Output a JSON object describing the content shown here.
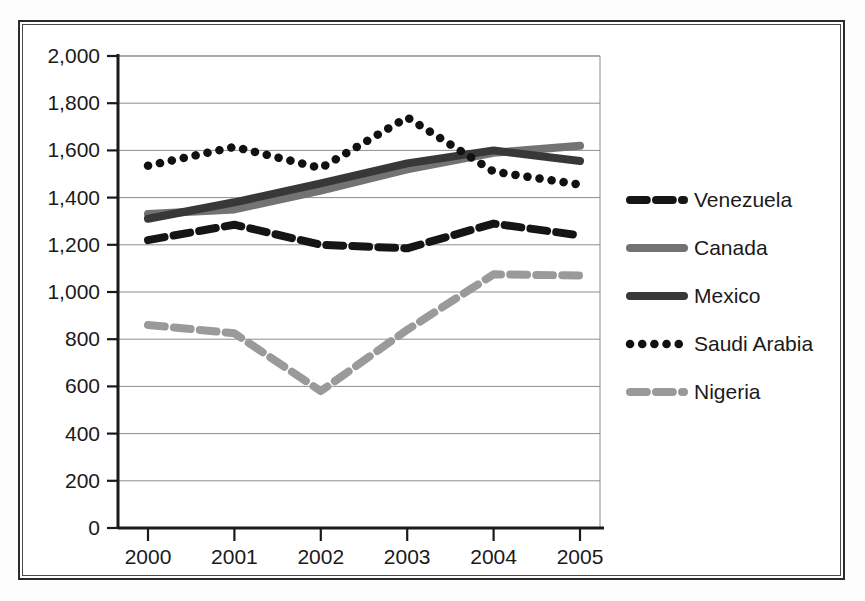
{
  "chart_data": {
    "type": "line",
    "title": "",
    "subtitle": "",
    "xlabel": "",
    "ylabel": "",
    "categories": [
      "2000",
      "2001",
      "2002",
      "2003",
      "2004",
      "2005"
    ],
    "x": [
      2000,
      2001,
      2002,
      2003,
      2004,
      2005
    ],
    "xlim": [
      2000,
      2005
    ],
    "ylim": [
      0,
      2000
    ],
    "ytick_labels": [
      "0",
      "200",
      "400",
      "600",
      "800",
      "1,000",
      "1,200",
      "1,400",
      "1,600",
      "1,800",
      "2,000"
    ],
    "ytick_values": [
      0,
      200,
      400,
      600,
      800,
      1000,
      1200,
      1400,
      1600,
      1800,
      2000
    ],
    "grid": "horizontal",
    "legend_position": "right",
    "series": [
      {
        "name": "Venezuela",
        "style": "dashed",
        "color": "#151515",
        "values": [
          1220,
          1285,
          1200,
          1185,
          1290,
          1240
        ]
      },
      {
        "name": "Canada",
        "style": "solid",
        "color": "#737373",
        "values": [
          1330,
          1350,
          1430,
          1520,
          1590,
          1620
        ]
      },
      {
        "name": "Mexico",
        "style": "solid",
        "color": "#383838",
        "values": [
          1310,
          1380,
          1460,
          1545,
          1600,
          1555
        ]
      },
      {
        "name": "Saudi Arabia",
        "style": "dotted",
        "color": "#111111",
        "values": [
          1535,
          1615,
          1525,
          1740,
          1510,
          1455
        ]
      },
      {
        "name": "Nigeria",
        "style": "dashed",
        "color": "#9a9a9a",
        "values": [
          860,
          825,
          580,
          840,
          1075,
          1070
        ]
      }
    ]
  },
  "legend": {
    "items": [
      {
        "label": "Venezuela"
      },
      {
        "label": "Canada"
      },
      {
        "label": "Mexico"
      },
      {
        "label": "Saudi Arabia"
      },
      {
        "label": "Nigeria"
      }
    ]
  }
}
